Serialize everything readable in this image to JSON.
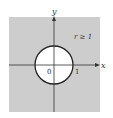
{
  "diagram": {
    "region_label": "r ≥ 1",
    "axes": {
      "x_label": "x",
      "y_label": "y"
    },
    "ticks": {
      "origin": "0",
      "x_one": "1"
    },
    "colors": {
      "shaded": "#cdcdcd",
      "circle_fill": "#ffffff",
      "stroke": "#222222"
    }
  }
}
